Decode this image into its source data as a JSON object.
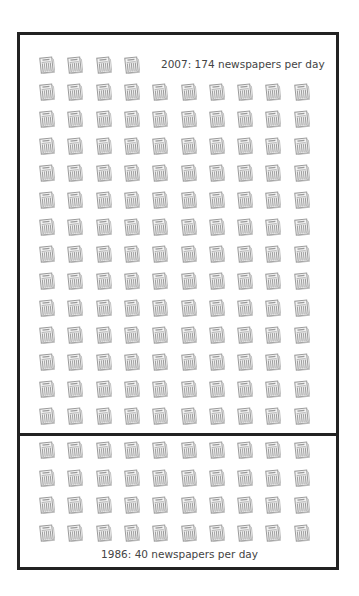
{
  "chart_data": {
    "type": "pictogram",
    "title": "",
    "unit": "newspaper icon = 1 newspaper",
    "columns": 10,
    "series": [
      {
        "name": "2007",
        "label": "2007: 174 newspapers per day",
        "value": 174
      },
      {
        "name": "1986",
        "label": "1986: 40 newspapers per day",
        "value": 40
      }
    ],
    "layout": {
      "top_box_rows": 14,
      "top_box_first_row_icons": 4,
      "top_box_icons": 134,
      "bottom_box_rows": 4,
      "bottom_box_icons": 40,
      "note": "2007 total (174) spans both boxes; 1986 (40) is the bottom box"
    }
  },
  "labels": {
    "top": "2007: 174 newspapers per day",
    "bottom": "1986: 40 newspapers per day"
  },
  "icon": {
    "name": "newspaper-icon",
    "color": "#9a9a9a"
  },
  "colors": {
    "frame": "#222222",
    "text": "#444444",
    "background": "#ffffff"
  }
}
